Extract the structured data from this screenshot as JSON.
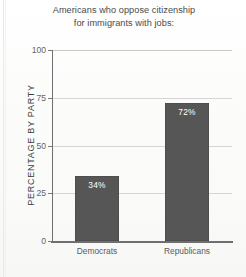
{
  "chart_data": {
    "type": "bar",
    "title": "Americans who oppose citizenship for immigrants with jobs:",
    "title_lines": [
      "Americans who oppose citizenship",
      "for immigrants with jobs:"
    ],
    "categories": [
      "Democrats",
      "Republicans"
    ],
    "values": [
      34,
      72
    ],
    "value_labels": [
      "34%",
      "72%"
    ],
    "xlabel": "",
    "ylabel": "PERCENTAGE BY PARTY",
    "ylim": [
      0,
      100
    ],
    "yticks": [
      0,
      25,
      50,
      75,
      100
    ],
    "ytick_labels": [
      "0",
      "25",
      "50",
      "75",
      "100"
    ],
    "grid": true,
    "legend": false,
    "bar_color": "#565656",
    "value_label_color": "#ffffff",
    "axis_color": "#6f6f6f",
    "grid_color": "#d6d6d6",
    "background_color": "#fbfbfa"
  }
}
